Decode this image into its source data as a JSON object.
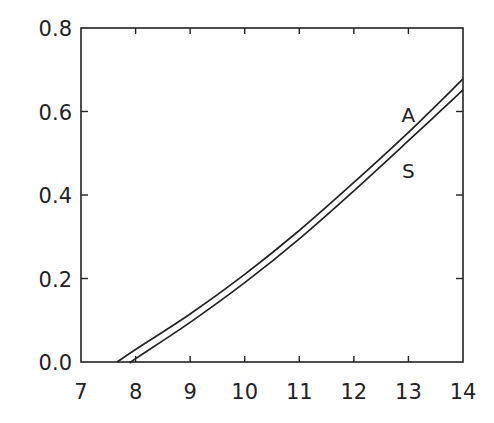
{
  "chart_data": {
    "type": "line",
    "title": "",
    "xlabel": "",
    "ylabel": "",
    "xlim": [
      7,
      14
    ],
    "ylim": [
      0,
      0.8
    ],
    "grid": false,
    "legend": "none (inline curve labels)",
    "x_ticks": [
      "7",
      "8",
      "9",
      "10",
      "11",
      "12",
      "13",
      "14"
    ],
    "y_ticks": [
      "0.0",
      "0.2",
      "0.4",
      "0.6",
      "0.8"
    ],
    "series": [
      {
        "name": "A",
        "x": [
          7.66,
          8,
          9,
          10,
          11,
          12,
          13,
          14
        ],
        "values": [
          0.0,
          0.03,
          0.115,
          0.21,
          0.315,
          0.43,
          0.55,
          0.678
        ]
      },
      {
        "name": "S",
        "x": [
          7.93,
          8,
          9,
          10,
          11,
          12,
          13,
          14
        ],
        "values": [
          0.0,
          0.008,
          0.095,
          0.19,
          0.295,
          0.41,
          0.53,
          0.652
        ]
      }
    ],
    "annotations": [
      {
        "text": "A",
        "x": 13.0,
        "y": 0.575
      },
      {
        "text": "S",
        "x": 13.0,
        "y": 0.44
      }
    ]
  }
}
